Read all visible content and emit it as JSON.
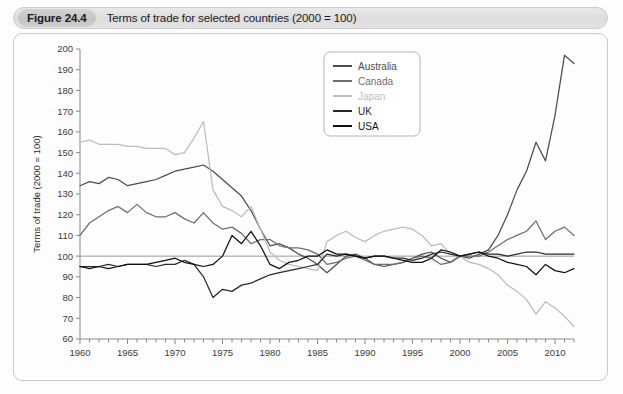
{
  "figure": {
    "badge": "Figure 24.4",
    "caption": "Terms of trade for selected countries (2000 = 100)"
  },
  "chart_data": {
    "type": "line",
    "title": "Terms of trade for selected countries (2000 = 100)",
    "xlabel": "",
    "ylabel": "Terms of trade (2000 = 100)",
    "xlim": [
      1960,
      2012
    ],
    "ylim": [
      60,
      200
    ],
    "ytick_step": 10,
    "yticks": [
      60,
      70,
      80,
      90,
      100,
      110,
      120,
      130,
      140,
      150,
      160,
      170,
      180,
      190,
      200
    ],
    "xticks_major": [
      1960,
      1965,
      1970,
      1975,
      1980,
      1985,
      1990,
      1995,
      2000,
      2005,
      2010
    ],
    "xtick_minor_step": 1,
    "grid": false,
    "reference_line": 100,
    "legend_position": "top-right",
    "x": [
      1960,
      1961,
      1962,
      1963,
      1964,
      1965,
      1966,
      1967,
      1968,
      1969,
      1970,
      1971,
      1972,
      1973,
      1974,
      1975,
      1976,
      1977,
      1978,
      1979,
      1980,
      1981,
      1982,
      1983,
      1984,
      1985,
      1986,
      1987,
      1988,
      1989,
      1990,
      1991,
      1992,
      1993,
      1994,
      1995,
      1996,
      1997,
      1998,
      1999,
      2000,
      2001,
      2002,
      2003,
      2004,
      2005,
      2006,
      2007,
      2008,
      2009,
      2010,
      2011,
      2012
    ],
    "series": [
      {
        "name": "Australia",
        "color": "#4d4d4d",
        "values": [
          134,
          136,
          135,
          138,
          137,
          134,
          135,
          136,
          137,
          139,
          141,
          142,
          143,
          144,
          141,
          137,
          133,
          129,
          122,
          113,
          105,
          106,
          104,
          101,
          99,
          96,
          92,
          96,
          100,
          101,
          99,
          96,
          95,
          96,
          97,
          99,
          101,
          102,
          99,
          97,
          100,
          99,
          101,
          103,
          110,
          120,
          132,
          141,
          155,
          146,
          168,
          197,
          193
        ]
      },
      {
        "name": "Canada",
        "color": "#6e6e6e",
        "values": [
          110,
          116,
          119,
          122,
          124,
          121,
          125,
          121,
          119,
          119,
          121,
          118,
          116,
          121,
          116,
          113,
          114,
          111,
          106,
          108,
          108,
          105,
          104,
          104,
          103,
          101,
          96,
          97,
          99,
          100,
          98,
          96,
          96,
          96,
          97,
          99,
          100,
          99,
          96,
          97,
          100,
          100,
          100,
          102,
          105,
          108,
          110,
          112,
          117,
          108,
          112,
          114,
          110
        ]
      },
      {
        "name": "Japan",
        "color": "#bcbcbc",
        "values": [
          155,
          156,
          154,
          154,
          154,
          153,
          153,
          152,
          152,
          152,
          149,
          150,
          157,
          165,
          132,
          124,
          122,
          119,
          124,
          113,
          102,
          98,
          96,
          95,
          94,
          93,
          107,
          110,
          112,
          109,
          107,
          110,
          112,
          113,
          114,
          113,
          110,
          105,
          106,
          101,
          100,
          97,
          96,
          94,
          91,
          86,
          83,
          79,
          72,
          78,
          75,
          71,
          66
        ]
      },
      {
        "name": "UK",
        "color": "#2a2a2a",
        "values": [
          95,
          95,
          95,
          96,
          95,
          96,
          96,
          96,
          95,
          96,
          96,
          98,
          96,
          90,
          80,
          84,
          83,
          86,
          87,
          89,
          91,
          92,
          93,
          94,
          95,
          96,
          101,
          100,
          101,
          100,
          99,
          100,
          100,
          99,
          99,
          98,
          99,
          101,
          102,
          101,
          100,
          101,
          102,
          101,
          101,
          100,
          101,
          102,
          102,
          101,
          101,
          101,
          101
        ]
      },
      {
        "name": "USA",
        "color": "#111111",
        "values": [
          95,
          94,
          95,
          94,
          95,
          96,
          96,
          96,
          97,
          98,
          99,
          97,
          96,
          95,
          96,
          100,
          110,
          106,
          112,
          105,
          96,
          94,
          97,
          98,
          100,
          100,
          103,
          101,
          101,
          100,
          99,
          100,
          100,
          99,
          98,
          97,
          97,
          99,
          103,
          102,
          100,
          101,
          102,
          100,
          99,
          97,
          96,
          95,
          91,
          96,
          93,
          92,
          94
        ]
      }
    ]
  }
}
